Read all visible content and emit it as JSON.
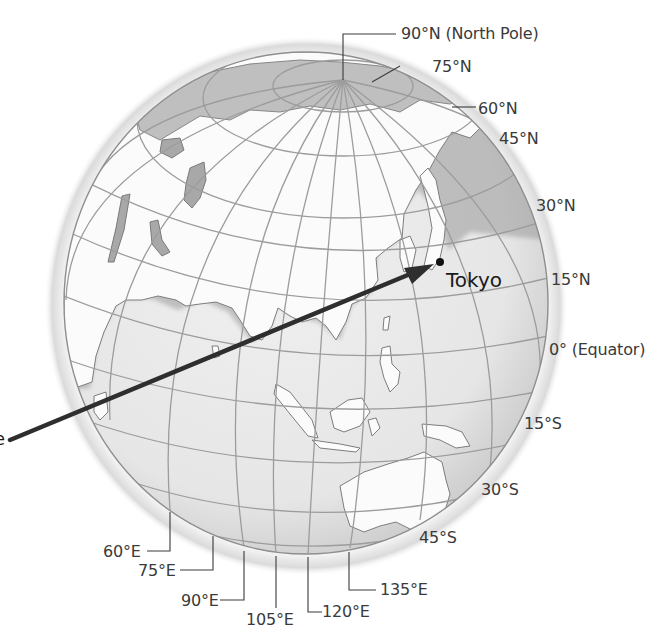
{
  "diagram": {
    "colors": {
      "land": "#fbfbfb",
      "ocean": "#e4e4e4",
      "coast_shadow": "#9a9a9a",
      "grid": "#9c9c9c",
      "arrow": "#2e2e2e",
      "label_text": "#3a3a3a"
    },
    "location_marker": {
      "label": "Tokyo",
      "marker": "filled-dot"
    },
    "arrow_source_partial_text": "e",
    "latitude_labels": {
      "north_pole": "90°N (North Pole)",
      "lat_75n": "75°N",
      "lat_60n": "60°N",
      "lat_45n": "45°N",
      "lat_30n": "30°N",
      "lat_15n": "15°N",
      "equator": "0° (Equator)",
      "lat_15s": "15°S",
      "lat_30s": "30°S",
      "lat_45s": "45°S"
    },
    "longitude_labels": {
      "lon_60e": "60°E",
      "lon_75e": "75°E",
      "lon_90e": "90°E",
      "lon_105e": "105°E",
      "lon_120e": "120°E",
      "lon_135e": "135°E"
    }
  }
}
